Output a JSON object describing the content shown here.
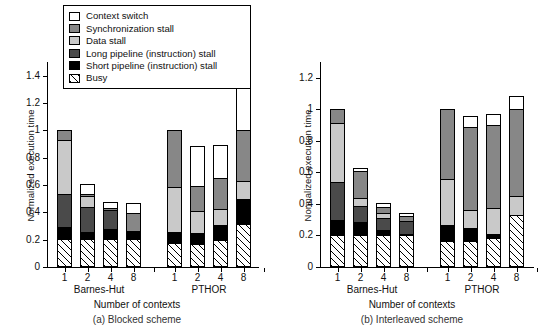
{
  "figure": {
    "ylabel": "Normalized execution time",
    "xlabel": "Number of contexts",
    "legend_title": "",
    "legend": [
      {
        "key": "context_switch",
        "label": "Context switch",
        "color": "#ffffff",
        "swatch": "solid"
      },
      {
        "key": "sync_stall",
        "label": "Synchronization stall",
        "color": "#878787",
        "swatch": "solid"
      },
      {
        "key": "data_stall",
        "label": "Data stall",
        "color": "#c9c9c9",
        "swatch": "solid"
      },
      {
        "key": "long_pipeline_stall",
        "label": "Long pipeline (instruction) stall",
        "color": "#4a4a4a",
        "swatch": "solid"
      },
      {
        "key": "short_pipeline_stall",
        "label": "Short pipeline (instruction) stall",
        "color": "#000000",
        "swatch": "solid"
      },
      {
        "key": "busy",
        "label": "Busy",
        "color": "#ffffff",
        "swatch": "hatched"
      }
    ]
  },
  "chart_data": [
    {
      "id": "a",
      "type": "bar",
      "stacked": true,
      "title": "(a) Blocked scheme",
      "xlabel": "Number of contexts",
      "ylabel": "Normalized execution time",
      "ylim": [
        0,
        1.5
      ],
      "yticks": [
        0,
        0.2,
        0.4,
        0.6,
        0.8,
        1,
        1.2,
        1.4
      ],
      "ytick_labels": [
        "0",
        "0.2",
        "0.4",
        "0.6",
        "0.8",
        "1",
        "1.2",
        "1.4"
      ],
      "grid": false,
      "legend_position": "top-center",
      "groups": [
        {
          "name": "Barnes-Hut",
          "categories": [
            "1",
            "2",
            "4",
            "8"
          ],
          "bars": [
            {
              "category": "1",
              "total": 1.0,
              "segments": {
                "busy": 0.195,
                "short_pipeline_stall": 0.085,
                "long_pipeline_stall": 0.245,
                "data_stall": 0.4,
                "sync_stall": 0.075,
                "context_switch": 0.0
              }
            },
            {
              "category": "2",
              "total": 0.605,
              "segments": {
                "busy": 0.195,
                "short_pipeline_stall": 0.055,
                "long_pipeline_stall": 0.185,
                "data_stall": 0.085,
                "sync_stall": 0.015,
                "context_switch": 0.07
              }
            },
            {
              "category": "4",
              "total": 0.475,
              "segments": {
                "busy": 0.195,
                "short_pipeline_stall": 0.075,
                "long_pipeline_stall": 0.145,
                "data_stall": 0.0,
                "sync_stall": 0.015,
                "context_switch": 0.045
              }
            },
            {
              "category": "8",
              "total": 0.465,
              "segments": {
                "busy": 0.195,
                "short_pipeline_stall": 0.065,
                "long_pipeline_stall": 0.0,
                "data_stall": 0.0,
                "sync_stall": 0.135,
                "context_switch": 0.07
              }
            }
          ]
        },
        {
          "name": "PTHOR",
          "categories": [
            "1",
            "2",
            "4",
            "8"
          ],
          "bars": [
            {
              "category": "1",
              "total": 1.0,
              "segments": {
                "busy": 0.16,
                "short_pipeline_stall": 0.085,
                "long_pipeline_stall": 0.0,
                "data_stall": 0.335,
                "sync_stall": 0.42,
                "context_switch": 0.0
              }
            },
            {
              "category": "2",
              "total": 0.885,
              "segments": {
                "busy": 0.16,
                "short_pipeline_stall": 0.075,
                "long_pipeline_stall": 0.0,
                "data_stall": 0.165,
                "sync_stall": 0.185,
                "context_switch": 0.3
              }
            },
            {
              "category": "4",
              "total": 0.895,
              "segments": {
                "busy": 0.185,
                "short_pipeline_stall": 0.115,
                "long_pipeline_stall": 0.0,
                "data_stall": 0.115,
                "sync_stall": 0.235,
                "context_switch": 0.245
              }
            },
            {
              "category": "8",
              "total": 1.4,
              "segments": {
                "busy": 0.3,
                "short_pipeline_stall": 0.185,
                "long_pipeline_stall": 0.0,
                "data_stall": 0.135,
                "sync_stall": 0.38,
                "context_switch": 0.4
              }
            }
          ]
        }
      ]
    },
    {
      "id": "b",
      "type": "bar",
      "stacked": true,
      "title": "(b) Interleaved scheme",
      "xlabel": "Number of contexts",
      "ylabel": "Normalized execution time",
      "ylim": [
        0,
        1.3
      ],
      "yticks": [
        0,
        0.2,
        0.4,
        0.6,
        0.8,
        1,
        1.2
      ],
      "ytick_labels": [
        "0",
        "0.2",
        "0.4",
        "0.6",
        "0.8",
        "1",
        "1.2"
      ],
      "grid": false,
      "legend_position": "shared-with-a",
      "groups": [
        {
          "name": "Barnes-Hut",
          "categories": [
            "1",
            "2",
            "4",
            "8"
          ],
          "bars": [
            {
              "category": "1",
              "total": 1.0,
              "segments": {
                "busy": 0.195,
                "short_pipeline_stall": 0.095,
                "long_pipeline_stall": 0.245,
                "data_stall": 0.375,
                "sync_stall": 0.09,
                "context_switch": 0.0
              }
            },
            {
              "category": "2",
              "total": 0.63,
              "segments": {
                "busy": 0.195,
                "short_pipeline_stall": 0.085,
                "long_pipeline_stall": 0.1,
                "data_stall": 0.055,
                "sync_stall": 0.175,
                "context_switch": 0.02
              }
            },
            {
              "category": "4",
              "total": 0.405,
              "segments": {
                "busy": 0.195,
                "short_pipeline_stall": 0.035,
                "long_pipeline_stall": 0.075,
                "data_stall": 0.035,
                "sync_stall": 0.04,
                "context_switch": 0.025
              }
            },
            {
              "category": "8",
              "total": 0.345,
              "segments": {
                "busy": 0.195,
                "short_pipeline_stall": 0.01,
                "long_pipeline_stall": 0.085,
                "data_stall": 0.0,
                "sync_stall": 0.035,
                "context_switch": 0.02
              }
            }
          ]
        },
        {
          "name": "PTHOR",
          "categories": [
            "1",
            "2",
            "4",
            "8"
          ],
          "bars": [
            {
              "category": "1",
              "total": 1.0,
              "segments": {
                "busy": 0.155,
                "short_pipeline_stall": 0.105,
                "long_pipeline_stall": 0.0,
                "data_stall": 0.295,
                "sync_stall": 0.445,
                "context_switch": 0.0
              }
            },
            {
              "category": "2",
              "total": 0.955,
              "segments": {
                "busy": 0.155,
                "short_pipeline_stall": 0.085,
                "long_pipeline_stall": 0.0,
                "data_stall": 0.115,
                "sync_stall": 0.53,
                "context_switch": 0.07
              }
            },
            {
              "category": "4",
              "total": 0.97,
              "segments": {
                "busy": 0.175,
                "short_pipeline_stall": 0.025,
                "long_pipeline_stall": 0.0,
                "data_stall": 0.165,
                "sync_stall": 0.535,
                "context_switch": 0.07
              }
            },
            {
              "category": "8",
              "total": 1.085,
              "segments": {
                "busy": 0.32,
                "short_pipeline_stall": 0.0,
                "long_pipeline_stall": 0.0,
                "data_stall": 0.125,
                "sync_stall": 0.555,
                "context_switch": 0.085
              }
            }
          ]
        }
      ]
    }
  ]
}
